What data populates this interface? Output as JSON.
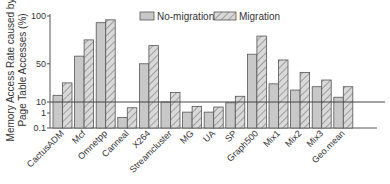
{
  "chart_data": {
    "type": "bar",
    "title": "",
    "xlabel": "",
    "ylabel": "Memory Access Rate caused by Page Table Accesses (%)",
    "ylabel_lines": [
      "Memory Access Rate caused by",
      "Page Table Accesses (%)"
    ],
    "y_scale": "broken: log below 10, linear 10-100",
    "yticks": [
      0.1,
      1,
      10,
      50,
      100
    ],
    "ytick_labels": [
      "0.1",
      "1",
      "10",
      "50",
      "100"
    ],
    "ylim": [
      0.1,
      100
    ],
    "reference_line": 10,
    "grid": false,
    "legend_position": "top",
    "categories": [
      "CactusADM",
      "Mcf",
      "Omnetpp",
      "Canneal",
      "X264",
      "Streamcluster",
      "MG",
      "UA",
      "SP",
      "Graph500",
      "Mix1",
      "Mix2",
      "Mix3",
      "Geo.mean"
    ],
    "series": [
      {
        "name": "No-migration",
        "pattern": "solid",
        "color": "#c8c8c8",
        "values": [
          17,
          58,
          93,
          0.5,
          50,
          10,
          1.2,
          1.2,
          8.5,
          60,
          29,
          22.5,
          26,
          15
        ]
      },
      {
        "name": "Migration",
        "pattern": "hatched",
        "color": "#d6d6d6",
        "values": [
          30,
          75,
          96,
          3,
          69,
          20,
          4,
          3.5,
          16,
          79,
          54,
          41,
          33,
          26
        ]
      }
    ]
  },
  "colors": {
    "axis": "#555555",
    "bar_stroke": "#555555",
    "hatch": "#777777"
  }
}
